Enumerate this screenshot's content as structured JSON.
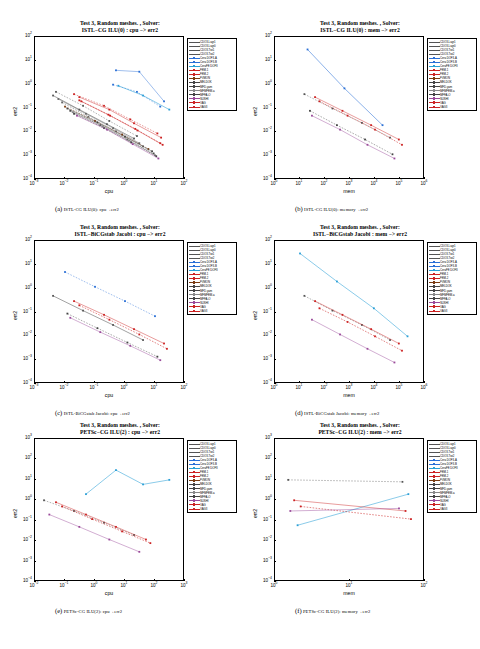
{
  "figure": {
    "common_title_line1": "Test 3, Random meshes. , Solver:",
    "legend_entries": [
      {
        "label": "CDO3-Lagr1",
        "color": "#555555",
        "marker": "plus"
      },
      {
        "label": "CDO3-Lagr0",
        "color": "#555555",
        "marker": "plus"
      },
      {
        "label": "CDO3-Twi1",
        "color": "#555555",
        "marker": "plus"
      },
      {
        "label": "CDO3-Twi2",
        "color": "#555555",
        "marker": "plus"
      },
      {
        "label": "Cera DOF3-A",
        "color": "#2a6fd6",
        "marker": "square"
      },
      {
        "label": "Cera DOF3-B",
        "color": "#2a6fd6",
        "marker": "square"
      },
      {
        "label": "CeraFE DOF3",
        "color": "#2a9fd6",
        "marker": "square"
      },
      {
        "label": "FEM-1",
        "color": "#cc2222",
        "marker": "square"
      },
      {
        "label": "FEM-2",
        "color": "#cc2222",
        "marker": "square"
      },
      {
        "label": "FVMON",
        "color": "#7a3b10",
        "marker": "square"
      },
      {
        "label": "MELDOK",
        "color": "#444444",
        "marker": "square"
      },
      {
        "label": "MFD-yam",
        "color": "#444444",
        "marker": "square"
      },
      {
        "label": "MFMFEM-a",
        "color": "#888888",
        "marker": "square"
      },
      {
        "label": "MFFA-O",
        "color": "#444444",
        "marker": "square"
      },
      {
        "label": "SUSHI",
        "color": "#9a4a9a",
        "marker": "square"
      },
      {
        "label": "VAG",
        "color": "#cc2222",
        "marker": "square"
      },
      {
        "label": "VAG3",
        "color": "#cc2222",
        "marker": "square"
      }
    ]
  },
  "panels": [
    {
      "id": "a",
      "title_line2": "ISTL−CG ILU(0) : cpu −> err2",
      "caption_letter": "(a)",
      "caption_text": "ISTL-CG ILU(0): cpu→err2",
      "xlabel": "cpu",
      "ylabel": "err2",
      "xticks": [
        "10-3",
        "10-2",
        "10-1",
        "100",
        "101",
        "102"
      ],
      "yticks": [
        "102",
        "101",
        "100",
        "10-1",
        "10-2",
        "10-3",
        "10-4"
      ]
    },
    {
      "id": "b",
      "title_line2": "ISTL−CG ILU(0) : mem −> err2",
      "caption_letter": "(b)",
      "caption_text": "ISTL-CG ILU(0): memory→err2",
      "xlabel": "mem",
      "ylabel": "err2",
      "xticks": [
        "100",
        "101",
        "102",
        "103",
        "104",
        "105",
        "106"
      ],
      "yticks": [
        "102",
        "101",
        "100",
        "10-1",
        "10-2",
        "10-3",
        "10-4"
      ]
    },
    {
      "id": "c",
      "title_line2": "ISTL−BiCGstab Jacobi : cpu −> err2",
      "caption_letter": "(c)",
      "caption_text": "ISTL-BiCGstab Jacobi: cpu→err2",
      "xlabel": "cpu",
      "ylabel": "err2",
      "xticks": [
        "10-3",
        "10-2",
        "10-1",
        "100",
        "101",
        "102"
      ],
      "yticks": [
        "102",
        "101",
        "100",
        "10-1",
        "10-2",
        "10-3",
        "10-4"
      ]
    },
    {
      "id": "d",
      "title_line2": "ISTL−BiCGstab Jacobi : mem −> err2",
      "caption_letter": "(d)",
      "caption_text": "ISTL-BiCGstab Jacobi: memory→err2",
      "xlabel": "mem",
      "ylabel": "err2",
      "xticks": [
        "100",
        "101",
        "102",
        "103",
        "104",
        "105",
        "106"
      ],
      "yticks": [
        "102",
        "101",
        "100",
        "10-1",
        "10-2",
        "10-3",
        "10-4"
      ]
    },
    {
      "id": "e",
      "title_line2": "PETSc−CG ILU(2) : cpu −> err2",
      "caption_letter": "(e)",
      "caption_text": "PETSc-CG ILU(2): cpu→err2",
      "xlabel": "cpu",
      "ylabel": "err2",
      "xticks": [
        "10-2",
        "10-1",
        "100",
        "101",
        "102",
        "103"
      ],
      "yticks": [
        "103",
        "102",
        "101",
        "100",
        "10-1",
        "10-2",
        "10-3",
        "10-4"
      ]
    },
    {
      "id": "f",
      "title_line2": "PETSc−CG ILU(2) : mem −> err2",
      "caption_letter": "(f)",
      "caption_text": "PETSc-CG ILU(2): memory→err2",
      "xlabel": "mem",
      "ylabel": "err2",
      "xticks": [
        "100",
        "101",
        "102"
      ],
      "yticks": [
        "103",
        "102",
        "101",
        "100",
        "10-1",
        "10-2",
        "10-3",
        "10-4"
      ]
    }
  ],
  "chart_data": {
    "type": "scatter",
    "xlabel": "cpu / mem",
    "ylabel": "err2",
    "grid": false,
    "legend_position": "right-outside",
    "xscale": "log",
    "yscale": "log",
    "panels": [
      {
        "id": "a",
        "xlim": [
          0.001,
          100
        ],
        "ylim": [
          0.0001,
          100
        ],
        "series": [
          {
            "name": "CDO3-Lagr1",
            "color": "#555555",
            "x": [
              0.004,
              0.03,
              0.25,
              2.0
            ],
            "y": [
              0.35,
              0.09,
              0.022,
              0.0055
            ]
          },
          {
            "name": "CDO3-Lagr0",
            "color": "#555555",
            "x": [
              0.005,
              0.04,
              0.3,
              2.5
            ],
            "y": [
              0.5,
              0.13,
              0.03,
              0.007
            ]
          },
          {
            "name": "CDO3-Twi1",
            "color": "#666666",
            "x": [
              0.006,
              0.05,
              0.4,
              3.0
            ],
            "y": [
              0.25,
              0.06,
              0.015,
              0.0035
            ]
          },
          {
            "name": "CDO3-Twi2",
            "color": "#666666",
            "x": [
              0.008,
              0.06,
              0.5,
              4.0
            ],
            "y": [
              0.18,
              0.045,
              0.011,
              0.0026
            ]
          },
          {
            "name": "Cera DOF3-A",
            "color": "#2a6fd6",
            "x": [
              0.5,
              3.0,
              20.0
            ],
            "y": [
              4.0,
              3.5,
              0.2
            ]
          },
          {
            "name": "Cera DOF3-B",
            "color": "#2a6fd6",
            "x": [
              0.4,
              2.5,
              15.0
            ],
            "y": [
              1.0,
              0.5,
              0.12
            ]
          },
          {
            "name": "CeraFE DOF3",
            "color": "#2a9fd6",
            "x": [
              0.6,
              4.0,
              30.0
            ],
            "y": [
              0.9,
              0.35,
              0.09
            ]
          },
          {
            "name": "FEM-1",
            "color": "#cc2222",
            "x": [
              0.02,
              0.2,
              1.5,
              12.0
            ],
            "y": [
              0.4,
              0.13,
              0.035,
              0.009
            ]
          },
          {
            "name": "FEM-2",
            "color": "#cc2222",
            "x": [
              0.03,
              0.3,
              2.0,
              16.0
            ],
            "y": [
              0.3,
              0.09,
              0.024,
              0.006
            ]
          },
          {
            "name": "FVMON",
            "color": "#7a3b10",
            "x": [
              0.01,
              0.1,
              0.8,
              6.0
            ],
            "y": [
              0.12,
              0.03,
              0.008,
              0.002
            ]
          },
          {
            "name": "MELDOK",
            "color": "#444444",
            "x": [
              0.012,
              0.12,
              1.0,
              8.0
            ],
            "y": [
              0.1,
              0.026,
              0.0065,
              0.0016
            ]
          },
          {
            "name": "MFD-yam",
            "color": "#444444",
            "x": [
              0.015,
              0.15,
              1.2,
              9.0
            ],
            "y": [
              0.08,
              0.02,
              0.005,
              0.0013
            ]
          },
          {
            "name": "MFMFEM-a",
            "color": "#888888",
            "x": [
              0.018,
              0.18,
              1.4,
              10.0
            ],
            "y": [
              0.07,
              0.018,
              0.0045,
              0.0011
            ]
          },
          {
            "name": "MFFA-O",
            "color": "#444444",
            "x": [
              0.02,
              0.2,
              1.6,
              11.0
            ],
            "y": [
              0.06,
              0.015,
              0.0038,
              0.001
            ]
          },
          {
            "name": "SUSHI",
            "color": "#9a4a9a",
            "x": [
              0.025,
              0.25,
              1.8,
              13.0
            ],
            "y": [
              0.05,
              0.013,
              0.0032,
              0.0008
            ]
          },
          {
            "name": "VAG",
            "color": "#cc2222",
            "x": [
              0.03,
              0.28,
              2.2,
              15.0
            ],
            "y": [
              0.22,
              0.055,
              0.014,
              0.0035
            ]
          },
          {
            "name": "VAG3",
            "color": "#cc2222",
            "x": [
              0.035,
              0.32,
              2.6,
              18.0
            ],
            "y": [
              0.2,
              0.05,
              0.012,
              0.003
            ]
          }
        ]
      },
      {
        "id": "b",
        "xlim": [
          1,
          1000000
        ],
        "ylim": [
          0.0001,
          100
        ],
        "series": [
          {
            "name": "Cera DOF3-A",
            "color": "#2a6fd6",
            "x": [
              20,
              600,
              20000
            ],
            "y": [
              30.0,
              0.7,
              0.02
            ]
          },
          {
            "name": "CDO3-Lagr1",
            "color": "#555555",
            "x": [
              15,
              200,
              3000,
              40000
            ],
            "y": [
              0.4,
              0.1,
              0.025,
              0.006
            ]
          },
          {
            "name": "FEM-1",
            "color": "#cc2222",
            "x": [
              40,
              500,
              7000,
              90000
            ],
            "y": [
              0.3,
              0.08,
              0.02,
              0.005
            ]
          },
          {
            "name": "VAG",
            "color": "#cc2222",
            "x": [
              60,
              800,
              10000,
              120000
            ],
            "y": [
              0.2,
              0.05,
              0.013,
              0.003
            ]
          },
          {
            "name": "SUSHI",
            "color": "#9a4a9a",
            "x": [
              30,
              400,
              5000,
              60000
            ],
            "y": [
              0.05,
              0.013,
              0.003,
              0.0008
            ]
          },
          {
            "name": "MFD-yam",
            "color": "#444444",
            "x": [
              25,
              300,
              4000,
              50000
            ],
            "y": [
              0.08,
              0.02,
              0.005,
              0.0012
            ]
          }
        ]
      },
      {
        "id": "c",
        "xlim": [
          0.001,
          100
        ],
        "ylim": [
          0.0001,
          100
        ],
        "series": [
          {
            "name": "CDO3-Lagr1",
            "color": "#555555",
            "x": [
              0.004,
              0.04,
              0.4,
              4.0
            ],
            "y": [
              0.5,
              0.12,
              0.03,
              0.007
            ]
          },
          {
            "name": "Cera DOF3-A",
            "color": "#2a6fd6",
            "x": [
              0.01,
              0.1,
              1.0,
              10.0
            ],
            "y": [
              5.0,
              1.2,
              0.3,
              0.07
            ]
          },
          {
            "name": "FEM-1",
            "color": "#cc2222",
            "x": [
              0.02,
              0.2,
              2.0,
              20.0
            ],
            "y": [
              0.3,
              0.08,
              0.02,
              0.005
            ]
          },
          {
            "name": "VAG",
            "color": "#cc2222",
            "x": [
              0.03,
              0.3,
              3.0,
              25.0
            ],
            "y": [
              0.2,
              0.05,
              0.012,
              0.003
            ]
          },
          {
            "name": "SUSHI",
            "color": "#9a4a9a",
            "x": [
              0.015,
              0.15,
              1.5,
              15.0
            ],
            "y": [
              0.06,
              0.015,
              0.004,
              0.001
            ]
          },
          {
            "name": "MFD-yam",
            "color": "#444444",
            "x": [
              0.012,
              0.12,
              1.2,
              12.0
            ],
            "y": [
              0.09,
              0.022,
              0.0055,
              0.0014
            ]
          }
        ]
      },
      {
        "id": "d",
        "xlim": [
          1,
          1000000
        ],
        "ylim": [
          0.0001,
          100
        ],
        "series": [
          {
            "name": "Cera DOF3-A",
            "color": "#2a9fd6",
            "x": [
              10,
              300,
              9000,
              200000
            ],
            "y": [
              30.0,
              2.0,
              0.15,
              0.01
            ]
          },
          {
            "name": "CDO3-Lagr1",
            "color": "#555555",
            "x": [
              15,
              200,
              3000,
              40000
            ],
            "y": [
              0.5,
              0.12,
              0.03,
              0.007
            ]
          },
          {
            "name": "FEM-1",
            "color": "#cc2222",
            "x": [
              40,
              500,
              7000,
              90000
            ],
            "y": [
              0.3,
              0.08,
              0.02,
              0.005
            ]
          },
          {
            "name": "VAG",
            "color": "#cc2222",
            "x": [
              60,
              800,
              10000,
              120000
            ],
            "y": [
              0.15,
              0.04,
              0.01,
              0.0025
            ]
          },
          {
            "name": "SUSHI",
            "color": "#9a4a9a",
            "x": [
              30,
              400,
              5000,
              60000
            ],
            "y": [
              0.05,
              0.012,
              0.003,
              0.0008
            ]
          }
        ]
      },
      {
        "id": "e",
        "xlim": [
          0.01,
          1000
        ],
        "ylim": [
          0.0001,
          1000
        ],
        "series": [
          {
            "name": "Cera DOF3-A",
            "color": "#2a9fd6",
            "x": [
              0.5,
              5.0,
              40.0,
              300.0
            ],
            "y": [
              2.0,
              30.0,
              6.0,
              10.0
            ]
          },
          {
            "name": "CDO3-Lagr1",
            "color": "#555555",
            "x": [
              0.02,
              0.2,
              2.0,
              20.0
            ],
            "y": [
              1.0,
              0.3,
              0.08,
              0.02
            ]
          },
          {
            "name": "FEM-1",
            "color": "#cc2222",
            "x": [
              0.05,
              0.5,
              5.0,
              50.0
            ],
            "y": [
              0.8,
              0.2,
              0.05,
              0.012
            ]
          },
          {
            "name": "VAG",
            "color": "#cc2222",
            "x": [
              0.08,
              0.8,
              8.0,
              70.0
            ],
            "y": [
              0.5,
              0.12,
              0.03,
              0.008
            ]
          },
          {
            "name": "SUSHI",
            "color": "#9a4a9a",
            "x": [
              0.03,
              0.3,
              3.0,
              30.0
            ],
            "y": [
              0.2,
              0.05,
              0.012,
              0.003
            ]
          }
        ]
      },
      {
        "id": "f",
        "xlim": [
          1,
          100
        ],
        "ylim": [
          0.0001,
          1000
        ],
        "series": [
          {
            "name": "Cera DOF3-A",
            "color": "#2a9fd6",
            "x": [
              2.0,
              60.0
            ],
            "y": [
              0.06,
              2.0
            ]
          },
          {
            "name": "CDO3-Lagr1",
            "color": "#555555",
            "x": [
              1.5,
              50.0
            ],
            "y": [
              10.0,
              8.0
            ]
          },
          {
            "name": "FEM-1",
            "color": "#cc2222",
            "x": [
              1.8,
              55.0
            ],
            "y": [
              1.0,
              0.3
            ]
          },
          {
            "name": "VAG",
            "color": "#cc2222",
            "x": [
              2.2,
              65.0
            ],
            "y": [
              0.5,
              0.12
            ]
          },
          {
            "name": "SUSHI",
            "color": "#9a4a9a",
            "x": [
              1.6,
              45.0
            ],
            "y": [
              0.3,
              0.4
            ]
          }
        ]
      }
    ]
  }
}
